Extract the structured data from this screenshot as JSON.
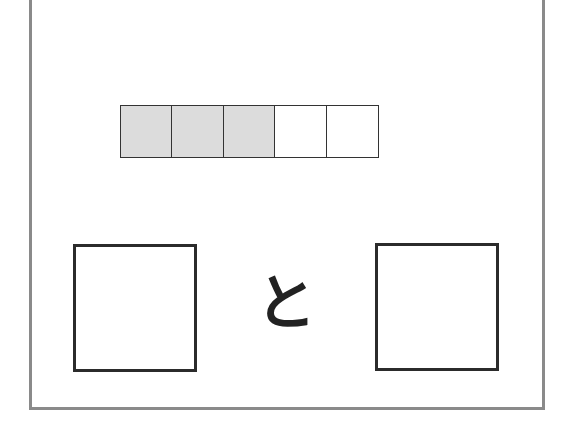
{
  "fraction_bar": {
    "total_cells": 5,
    "shaded_cells": 3,
    "cells": [
      {
        "shaded": true
      },
      {
        "shaded": true
      },
      {
        "shaded": true
      },
      {
        "shaded": false
      },
      {
        "shaded": false
      }
    ],
    "shade_color": "#dcdcdc",
    "border_color": "#333333"
  },
  "answer_boxes": {
    "left": {
      "value": ""
    },
    "right": {
      "value": ""
    }
  },
  "connector": {
    "text": "と"
  },
  "colors": {
    "frame": "#8a8a8a",
    "box_border": "#2b2b2b",
    "background": "#ffffff"
  }
}
